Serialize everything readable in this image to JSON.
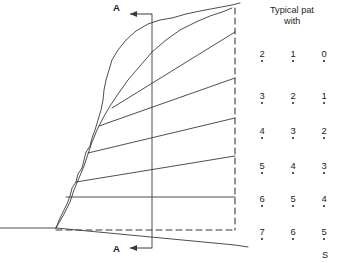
{
  "figure": {
    "kind": "slope-cross-section-diagram",
    "background": "#ffffff",
    "line_color": "#3a3a3a",
    "text_color": "#1d1d1d"
  },
  "caption": {
    "line1": "Typical pat",
    "line2": "with ",
    "footer": "S"
  },
  "section_markers": {
    "top_label": "A",
    "bottom_label": "A",
    "arrow_direction": "left"
  },
  "point_grid": {
    "columns_x": [
      262,
      293,
      324
    ],
    "rows_y": [
      58,
      100,
      135,
      170,
      203,
      236
    ],
    "rows": [
      {
        "values": [
          "2",
          "1",
          "0"
        ]
      },
      {
        "values": [
          "3",
          "2",
          "1"
        ]
      },
      {
        "values": [
          "4",
          "3",
          "2"
        ]
      },
      {
        "values": [
          "5",
          "4",
          "3"
        ]
      },
      {
        "values": [
          "6",
          "5",
          "4"
        ]
      },
      {
        "values": [
          "7",
          "6",
          "5"
        ]
      }
    ]
  },
  "chart_data": {
    "type": "line",
    "title": "Typical pat",
    "xlabel": "",
    "ylabel": "",
    "series": [
      {
        "name": "ground-surface-profile",
        "points": [
          [
            56,
            228
          ],
          [
            60,
            218
          ],
          [
            64,
            210
          ],
          [
            67,
            204
          ],
          [
            70,
            196
          ],
          [
            72,
            188
          ],
          [
            76,
            182
          ],
          [
            78,
            174
          ],
          [
            82,
            168
          ],
          [
            84,
            160
          ],
          [
            86,
            152
          ],
          [
            90,
            146
          ],
          [
            92,
            138
          ],
          [
            95,
            130
          ],
          [
            98,
            120
          ],
          [
            101,
            110
          ],
          [
            103,
            100
          ],
          [
            104,
            90
          ],
          [
            106,
            80
          ],
          [
            109,
            70
          ],
          [
            112,
            60
          ],
          [
            118,
            50
          ],
          [
            126,
            40
          ],
          [
            136,
            31
          ],
          [
            148,
            24
          ],
          [
            160,
            20
          ],
          [
            172,
            18
          ],
          [
            186,
            14
          ],
          [
            200,
            11
          ],
          [
            216,
            8
          ],
          [
            232,
            5
          ],
          [
            240,
            3
          ]
        ]
      },
      {
        "name": "slope-face-lower",
        "points": [
          [
            56,
            228
          ],
          [
            64,
            214
          ],
          [
            70,
            202
          ],
          [
            74,
            190
          ],
          [
            79,
            178
          ],
          [
            84,
            166
          ],
          [
            88,
            154
          ],
          [
            92,
            142
          ],
          [
            97,
            130
          ],
          [
            103,
            118
          ],
          [
            110,
            106
          ],
          [
            118,
            94
          ],
          [
            128,
            80
          ],
          [
            140,
            66
          ],
          [
            152,
            52
          ],
          [
            166,
            40
          ],
          [
            180,
            30
          ],
          [
            196,
            22
          ],
          [
            210,
            16
          ],
          [
            222,
            12
          ],
          [
            232,
            8
          ]
        ]
      },
      {
        "name": "ray-line-1",
        "points": [
          [
            112,
            108
          ],
          [
            235,
            32
          ]
        ]
      },
      {
        "name": "ray-line-2",
        "points": [
          [
            99,
            126
          ],
          [
            235,
            78
          ]
        ]
      },
      {
        "name": "ray-line-3",
        "points": [
          [
            88,
            153
          ],
          [
            235,
            118
          ]
        ]
      },
      {
        "name": "ray-line-4",
        "points": [
          [
            76,
            182
          ],
          [
            235,
            156
          ]
        ]
      },
      {
        "name": "ray-line-5-horizontal",
        "points": [
          [
            66,
            197
          ],
          [
            235,
            197
          ]
        ]
      },
      {
        "name": "ray-line-6-descending",
        "points": [
          [
            56,
            228
          ],
          [
            235,
            245
          ],
          [
            248,
            247
          ]
        ]
      }
    ],
    "reference_lines": [
      {
        "name": "ground-line-left",
        "type": "solid",
        "points": [
          [
            0,
            228
          ],
          [
            56,
            228
          ]
        ]
      },
      {
        "name": "baseline-dashed",
        "type": "dashed",
        "points": [
          [
            56,
            230
          ],
          [
            235,
            230
          ]
        ]
      },
      {
        "name": "right-boundary-dashed",
        "type": "dashed",
        "points": [
          [
            235,
            8
          ],
          [
            235,
            230
          ]
        ]
      },
      {
        "name": "section-axis-vertical",
        "type": "solid",
        "points": [
          [
            152,
            14
          ],
          [
            152,
            248
          ]
        ]
      }
    ],
    "grid": false,
    "legend": "none"
  }
}
